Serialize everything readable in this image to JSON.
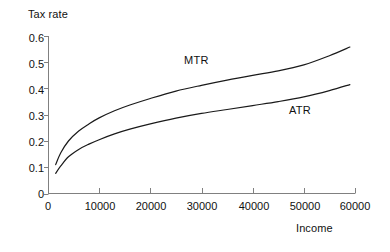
{
  "chart_data": {
    "type": "line",
    "title": "",
    "xlabel": "Income",
    "ylabel": "Tax rate",
    "xlim": [
      0,
      60000
    ],
    "ylim": [
      0,
      0.6
    ],
    "grid": false,
    "legend_position": "inline-annotations",
    "x_ticks": [
      0,
      10000,
      20000,
      30000,
      40000,
      50000,
      60000
    ],
    "x_tick_labels": [
      "0",
      "10000",
      "20000",
      "30000",
      "40000",
      "50000",
      "60000"
    ],
    "y_ticks": [
      0,
      0.1,
      0.2,
      0.3,
      0.4,
      0.5,
      0.6
    ],
    "y_tick_labels": [
      "0",
      "0.1",
      "0.2",
      "0.3",
      "0.4",
      "0.5",
      "0.6"
    ],
    "series": [
      {
        "name": "MTR",
        "label": "MTR",
        "color": "#1a1a1a",
        "x": [
          1500,
          2500,
          4000,
          6000,
          8000,
          10000,
          13000,
          16000,
          20000,
          25000,
          30000,
          35000,
          40000,
          45000,
          50000,
          55000,
          59000
        ],
        "values": [
          0.11,
          0.155,
          0.2,
          0.238,
          0.265,
          0.288,
          0.315,
          0.337,
          0.362,
          0.39,
          0.412,
          0.432,
          0.45,
          0.467,
          0.49,
          0.525,
          0.558
        ]
      },
      {
        "name": "ATR",
        "label": "ATR",
        "color": "#1a1a1a",
        "x": [
          1500,
          2500,
          4000,
          6000,
          8000,
          10000,
          13000,
          16000,
          20000,
          25000,
          30000,
          35000,
          40000,
          45000,
          50000,
          55000,
          59000
        ],
        "values": [
          0.077,
          0.105,
          0.14,
          0.168,
          0.188,
          0.205,
          0.227,
          0.245,
          0.265,
          0.287,
          0.305,
          0.32,
          0.335,
          0.35,
          0.368,
          0.392,
          0.415
        ]
      }
    ],
    "annotations": [
      {
        "text": "MTR",
        "x": 22000,
        "y": 0.525
      },
      {
        "text": "ATR",
        "x": 43000,
        "y": 0.345
      }
    ]
  },
  "axes": {
    "y_title": "Tax rate",
    "x_title": "Income"
  }
}
